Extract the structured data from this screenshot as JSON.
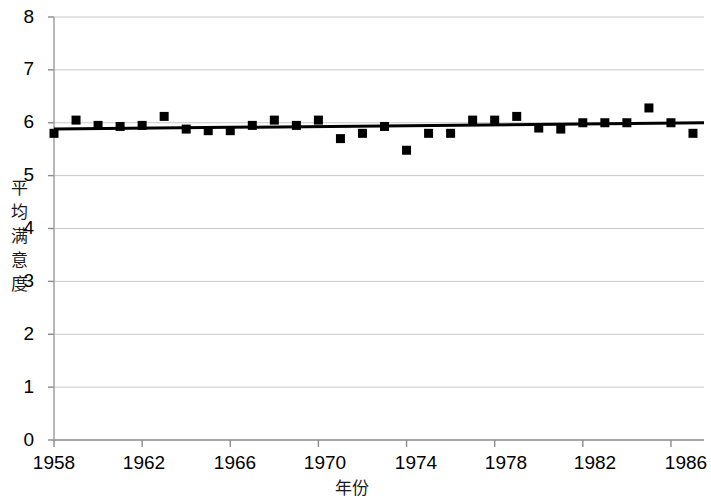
{
  "chart_data": {
    "type": "scatter",
    "title": "",
    "xlabel": "年份",
    "ylabel": "平均满意度",
    "xlim": [
      1958,
      1987.5
    ],
    "ylim": [
      0,
      8
    ],
    "grid": true,
    "legend": "none",
    "x_ticks": [
      "1958",
      "1962",
      "1966",
      "1970",
      "1974",
      "1978",
      "1982",
      "1986"
    ],
    "x_tick_values": [
      1958,
      1962,
      1966,
      1970,
      1974,
      1978,
      1982,
      1986
    ],
    "y_ticks": [
      "0",
      "1",
      "2",
      "3",
      "4",
      "5",
      "6",
      "7",
      "8"
    ],
    "y_tick_values": [
      0,
      1,
      2,
      3,
      4,
      5,
      6,
      7,
      8
    ],
    "marker": "square",
    "marker_color": "#000000",
    "marker_size": 9,
    "x": [
      1958,
      1959,
      1960,
      1961,
      1962,
      1963,
      1964,
      1965,
      1966,
      1967,
      1968,
      1969,
      1970,
      1971,
      1972,
      1973,
      1974,
      1975,
      1976,
      1977,
      1978,
      1979,
      1980,
      1981,
      1982,
      1983,
      1984,
      1985,
      1986,
      1987
    ],
    "values": [
      5.8,
      6.05,
      5.95,
      5.93,
      5.95,
      6.12,
      5.88,
      5.85,
      5.85,
      5.95,
      6.05,
      5.95,
      6.05,
      5.7,
      5.8,
      5.93,
      5.48,
      5.8,
      5.8,
      6.05,
      6.05,
      6.12,
      5.9,
      5.88,
      6.0,
      6.0,
      6.0,
      6.28,
      6.0,
      5.8
    ],
    "trendline": {
      "visible": true,
      "color": "#000000",
      "width": 3,
      "start": {
        "x": 1958,
        "y": 5.88
      },
      "end": {
        "x": 1987.5,
        "y": 6.0
      }
    }
  }
}
